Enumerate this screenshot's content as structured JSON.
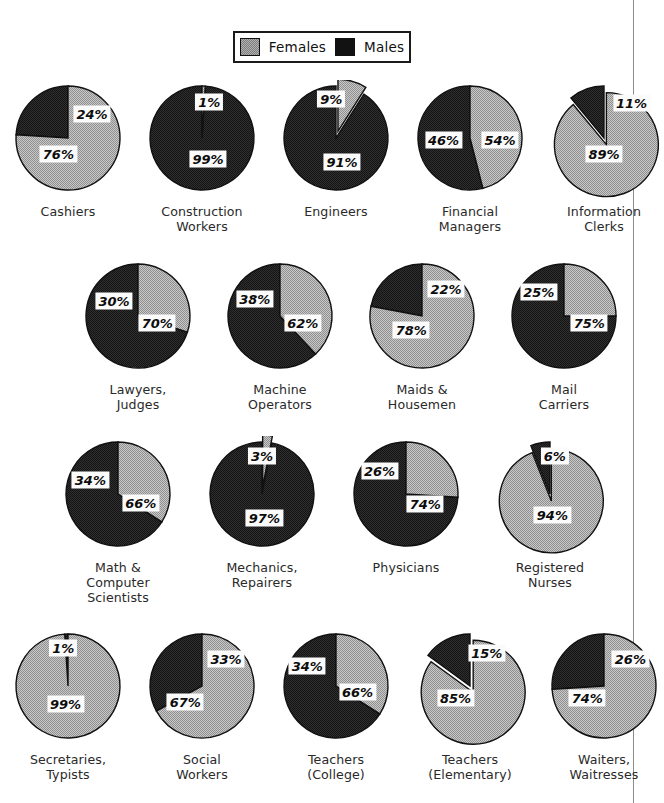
{
  "legend": {
    "items": [
      {
        "label": "Females",
        "swatch": "female-swatch",
        "color": "#b0b0b0"
      },
      {
        "label": "Males",
        "swatch": "male-swatch",
        "color": "#121212"
      }
    ]
  },
  "chart_data": {
    "type": "pie",
    "title": "",
    "legend": [
      "Females",
      "Males"
    ],
    "legend_position": "top",
    "series_names": [
      "Females",
      "Males"
    ],
    "colors": {
      "Females": "#b0b0b0",
      "Males": "#121212"
    },
    "unit": "%",
    "categories": [
      "Cashiers",
      "Construction Workers",
      "Engineers",
      "Financial Managers",
      "Information Clerks",
      "Lawyers, Judges",
      "Machine Operators",
      "Maids & Housemen",
      "Mail Carriers",
      "Math & Computer Scientists",
      "Mechanics, Repairers",
      "Physicians",
      "Registered Nurses",
      "Secretaries, Typists",
      "Social Workers",
      "Teachers (College)",
      "Teachers (Elementary)",
      "Waiters, Waitresses"
    ],
    "series": [
      {
        "name": "Females",
        "values": [
          76,
          1,
          9,
          46,
          89,
          30,
          38,
          78,
          25,
          34,
          3,
          26,
          94,
          99,
          67,
          34,
          85,
          74
        ]
      },
      {
        "name": "Males",
        "values": [
          24,
          99,
          91,
          54,
          11,
          70,
          62,
          22,
          75,
          66,
          97,
          74,
          6,
          1,
          33,
          66,
          15,
          26
        ]
      }
    ]
  },
  "rows": [
    {
      "cells": [
        {
          "caption": "Cashiers",
          "female": 76,
          "male": 24,
          "female_label": "76%",
          "male_label": "24%",
          "exploded": false,
          "fx": 42,
          "fy": 62,
          "mx": 70,
          "my": 28
        },
        {
          "caption": "Construction\nWorkers",
          "female": 1,
          "male": 99,
          "female_label": "1%",
          "male_label": "99%",
          "exploded": false,
          "fx": 56,
          "fy": 18,
          "mx": 55,
          "my": 66
        },
        {
          "caption": "Engineers",
          "female": 9,
          "male": 91,
          "female_label": "9%",
          "male_label": "91%",
          "exploded": true,
          "fx": 46,
          "fy": 16,
          "mx": 55,
          "my": 68
        },
        {
          "caption": "Financial\nManagers",
          "female": 46,
          "male": 54,
          "female_label": "46%",
          "male_label": "54%",
          "exploded": false,
          "fx": 28,
          "fy": 50,
          "mx": 75,
          "my": 50
        },
        {
          "caption": "Information\nClerks",
          "female": 89,
          "male": 11,
          "female_label": "89%",
          "male_label": "11%",
          "exploded": true,
          "fx": 50,
          "fy": 62,
          "mx": 73,
          "my": 19
        }
      ]
    },
    {
      "cells": [
        {
          "caption": "Lawyers,\nJudges",
          "female": 30,
          "male": 70,
          "female_label": "30%",
          "male_label": "70%",
          "exploded": false,
          "fx": 30,
          "fy": 36,
          "mx": 66,
          "my": 54
        },
        {
          "caption": "Machine\nOperators",
          "female": 38,
          "male": 62,
          "female_label": "38%",
          "male_label": "62%",
          "exploded": false,
          "fx": 29,
          "fy": 34,
          "mx": 69,
          "my": 54
        },
        {
          "caption": "Maids &\nHousemen",
          "female": 78,
          "male": 22,
          "female_label": "78%",
          "male_label": "22%",
          "exploded": false,
          "fx": 41,
          "fy": 60,
          "mx": 70,
          "my": 26
        },
        {
          "caption": "Mail\nCarriers",
          "female": 25,
          "male": 75,
          "female_label": "25%",
          "male_label": "75%",
          "exploded": false,
          "fx": 29,
          "fy": 28,
          "mx": 71,
          "my": 54
        }
      ]
    },
    {
      "cells": [
        {
          "caption": "Math &\nComputer\nScientists",
          "female": 34,
          "male": 66,
          "female_label": "34%",
          "male_label": "66%",
          "exploded": false,
          "fx": 27,
          "fy": 37,
          "mx": 69,
          "my": 56
        },
        {
          "caption": "Mechanics,\nRepairers",
          "female": 3,
          "male": 97,
          "female_label": "3%",
          "male_label": "97%",
          "exploded": true,
          "fx": 50,
          "fy": 17,
          "mx": 52,
          "my": 68
        },
        {
          "caption": "Physicians",
          "female": 26,
          "male": 74,
          "female_label": "26%",
          "male_label": "74%",
          "exploded": false,
          "fx": 28,
          "fy": 29,
          "mx": 66,
          "my": 57
        },
        {
          "caption": "Registered\nNurses",
          "female": 94,
          "male": 6,
          "female_label": "94%",
          "male_label": "6%",
          "exploded": true,
          "fx": 52,
          "fy": 66,
          "mx": 54,
          "my": 17
        }
      ]
    },
    {
      "cells": [
        {
          "caption": "Secretaries,\nTypists",
          "female": 99,
          "male": 1,
          "female_label": "99%",
          "male_label": "1%",
          "exploded": false,
          "fx": 48,
          "fy": 63,
          "mx": 46,
          "my": 17
        },
        {
          "caption": "Social\nWorkers",
          "female": 67,
          "male": 33,
          "female_label": "67%",
          "male_label": "33%",
          "exploded": false,
          "fx": 36,
          "fy": 62,
          "mx": 70,
          "my": 26
        },
        {
          "caption": "Teachers\n(College)",
          "female": 34,
          "male": 66,
          "female_label": "34%",
          "male_label": "66%",
          "exploded": false,
          "fx": 26,
          "fy": 32,
          "mx": 68,
          "my": 53
        },
        {
          "caption": "Teachers\n(Elementary)",
          "female": 85,
          "male": 15,
          "female_label": "85%",
          "male_label": "15%",
          "exploded": true,
          "fx": 38,
          "fy": 58,
          "mx": 64,
          "my": 21
        },
        {
          "caption": "Waiters,\nWaitresses",
          "female": 74,
          "male": 26,
          "female_label": "74%",
          "male_label": "26%",
          "exploded": false,
          "fx": 36,
          "fy": 58,
          "mx": 72,
          "my": 26
        }
      ]
    }
  ]
}
